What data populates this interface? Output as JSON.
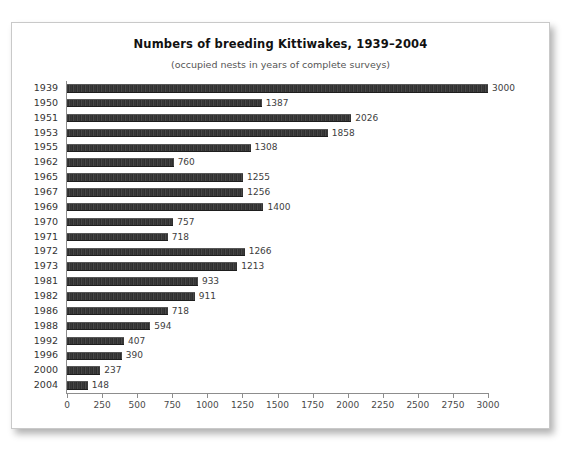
{
  "chart_data": {
    "type": "bar",
    "orientation": "horizontal",
    "title": "Numbers of breeding Kittiwakes, 1939–2004",
    "subtitle": "(occupied nests in years of complete surveys)",
    "xlabel": "",
    "ylabel": "",
    "xlim": [
      0,
      3000
    ],
    "xtick_step": 250,
    "grid": false,
    "legend": null,
    "bar_color": "#383838",
    "categories": [
      "1939",
      "1950",
      "1951",
      "1953",
      "1955",
      "1962",
      "1965",
      "1967",
      "1969",
      "1970",
      "1971",
      "1972",
      "1973",
      "1981",
      "1982",
      "1986",
      "1988",
      "1992",
      "1996",
      "2000",
      "2004"
    ],
    "values": [
      3000,
      1387,
      2026,
      1858,
      1308,
      760,
      1255,
      1256,
      1400,
      757,
      718,
      1266,
      1213,
      933,
      911,
      718,
      594,
      407,
      390,
      237,
      148
    ],
    "value_labels": [
      "3000",
      "1387",
      "2026",
      "1858",
      "1308",
      "760",
      "1255",
      "1256",
      "1400",
      "757",
      "718",
      "1266",
      "1213",
      "933",
      "911",
      "718",
      "594",
      "407",
      "390",
      "237",
      "148"
    ],
    "xticks": [
      0,
      250,
      500,
      750,
      1000,
      1250,
      1500,
      1750,
      2000,
      2250,
      2500,
      2750,
      3000
    ],
    "xtick_labels": [
      "0",
      "250",
      "500",
      "750",
      "1000",
      "1250",
      "1500",
      "1750",
      "2000",
      "2250",
      "2500",
      "2750",
      "3000"
    ]
  }
}
